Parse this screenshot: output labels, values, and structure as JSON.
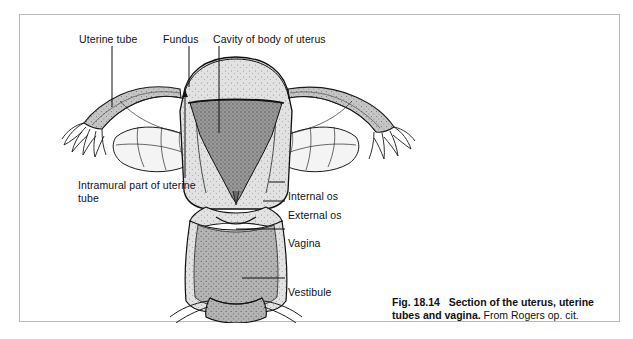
{
  "figure": {
    "number": "Fig. 18.14",
    "title": "Section of the uterus, uterine tubes and vagina.",
    "source": " From Rogers op. cit.",
    "caption_full": "Fig. 18.14   Section of the uterus, uterine tubes and vagina. From Rogers op. cit."
  },
  "labels": {
    "uterine_tube": "Uterine tube",
    "fundus": "Fundus",
    "cavity": "Cavity of body of uterus",
    "intramural": "Intramural part of uterine tube",
    "internal_os": "Internal os",
    "external_os": "External os",
    "vagina": "Vagina",
    "vestibule": "Vestibule"
  },
  "colors": {
    "page_background": "#ffffff",
    "frame_border": "#b9b9b9",
    "ink": "#111111",
    "leader_line": "#1a1a1a",
    "cavity_fill": "#8d8d8d",
    "myometrium_fill": "#d8d8d8",
    "wall_light": "#e8e8e8",
    "vagina_fill": "#a8a8a8",
    "vestibule_fill": "#9e9e9e",
    "tube_fill": "#bdbdbd",
    "ovary_fill": "#f2f2f2"
  }
}
